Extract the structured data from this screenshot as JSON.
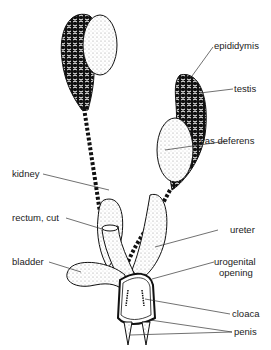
{
  "diagram": {
    "labels": {
      "epididymis": "epididymis",
      "testis": "testis",
      "vas_deferens": "vas deferens",
      "kidney": "kidney",
      "rectum": "rectum, cut",
      "ureter": "ureter",
      "urogenital_1": "urogenital",
      "urogenital_2": "opening",
      "bladder": "bladder",
      "cloaca": "cloaca",
      "penis": "penis"
    },
    "colors": {
      "ink": "#111111",
      "stipple": "#d8d8d8",
      "background": "#ffffff"
    }
  }
}
